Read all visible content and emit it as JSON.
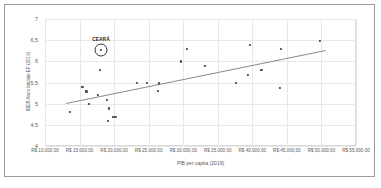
{
  "figure": {
    "highlight": {
      "label": "CEARÁ",
      "x": 18100,
      "y": 6.27
    },
    "marker_color": "#595959",
    "trendline_color": "#8c8c8c",
    "grid_color": "#e8e8e8",
    "frame_color": "#d9d9d9"
  },
  "chart_data": {
    "type": "scatter",
    "title": "",
    "xlabel": "PIB per capita (2019)",
    "ylabel": "IDEB Anos Iniciais-EF (2019)",
    "xlim": [
      10000,
      55000
    ],
    "ylim": [
      4,
      7
    ],
    "grid": true,
    "legend": false,
    "xticks": [
      10000,
      15000,
      20000,
      25000,
      30000,
      35000,
      40000,
      45000,
      50000,
      55000
    ],
    "xticklabels": [
      "R$ 10.000,00",
      "R$ 15.000,00",
      "R$ 20.000,00",
      "R$ 25.000,00",
      "R$ 30.000,00",
      "R$ 35.000,00",
      "R$ 40.000,00",
      "R$ 45.000,00",
      "R$ 50.000,00",
      "R$ 55.000,00"
    ],
    "yticks": [
      4,
      4.5,
      5,
      5.5,
      6,
      6.5,
      7
    ],
    "yticklabels": [
      "4",
      "4,5",
      "5",
      "5,5",
      "6",
      "6,5",
      "7"
    ],
    "points": [
      {
        "x": 13600,
        "y": 4.8
      },
      {
        "x": 15400,
        "y": 5.39
      },
      {
        "x": 16000,
        "y": 5.29
      },
      {
        "x": 16300,
        "y": 5.0
      },
      {
        "x": 17700,
        "y": 5.2
      },
      {
        "x": 18000,
        "y": 5.79
      },
      {
        "x": 18100,
        "y": 6.27
      },
      {
        "x": 18900,
        "y": 5.08
      },
      {
        "x": 19300,
        "y": 4.89
      },
      {
        "x": 19100,
        "y": 4.59
      },
      {
        "x": 19900,
        "y": 4.68
      },
      {
        "x": 20200,
        "y": 4.68
      },
      {
        "x": 23300,
        "y": 5.49
      },
      {
        "x": 24700,
        "y": 5.49
      },
      {
        "x": 26500,
        "y": 5.48
      },
      {
        "x": 26300,
        "y": 5.3
      },
      {
        "x": 29700,
        "y": 6.0
      },
      {
        "x": 30500,
        "y": 6.29
      },
      {
        "x": 33100,
        "y": 5.89
      },
      {
        "x": 37600,
        "y": 5.49
      },
      {
        "x": 39600,
        "y": 6.39
      },
      {
        "x": 39400,
        "y": 5.68
      },
      {
        "x": 41300,
        "y": 5.79
      },
      {
        "x": 44100,
        "y": 6.29
      },
      {
        "x": 44000,
        "y": 5.38
      },
      {
        "x": 49800,
        "y": 6.48
      }
    ],
    "trendline": {
      "x0": 13000,
      "y0": 5.02,
      "x1": 50500,
      "y1": 6.27
    }
  }
}
